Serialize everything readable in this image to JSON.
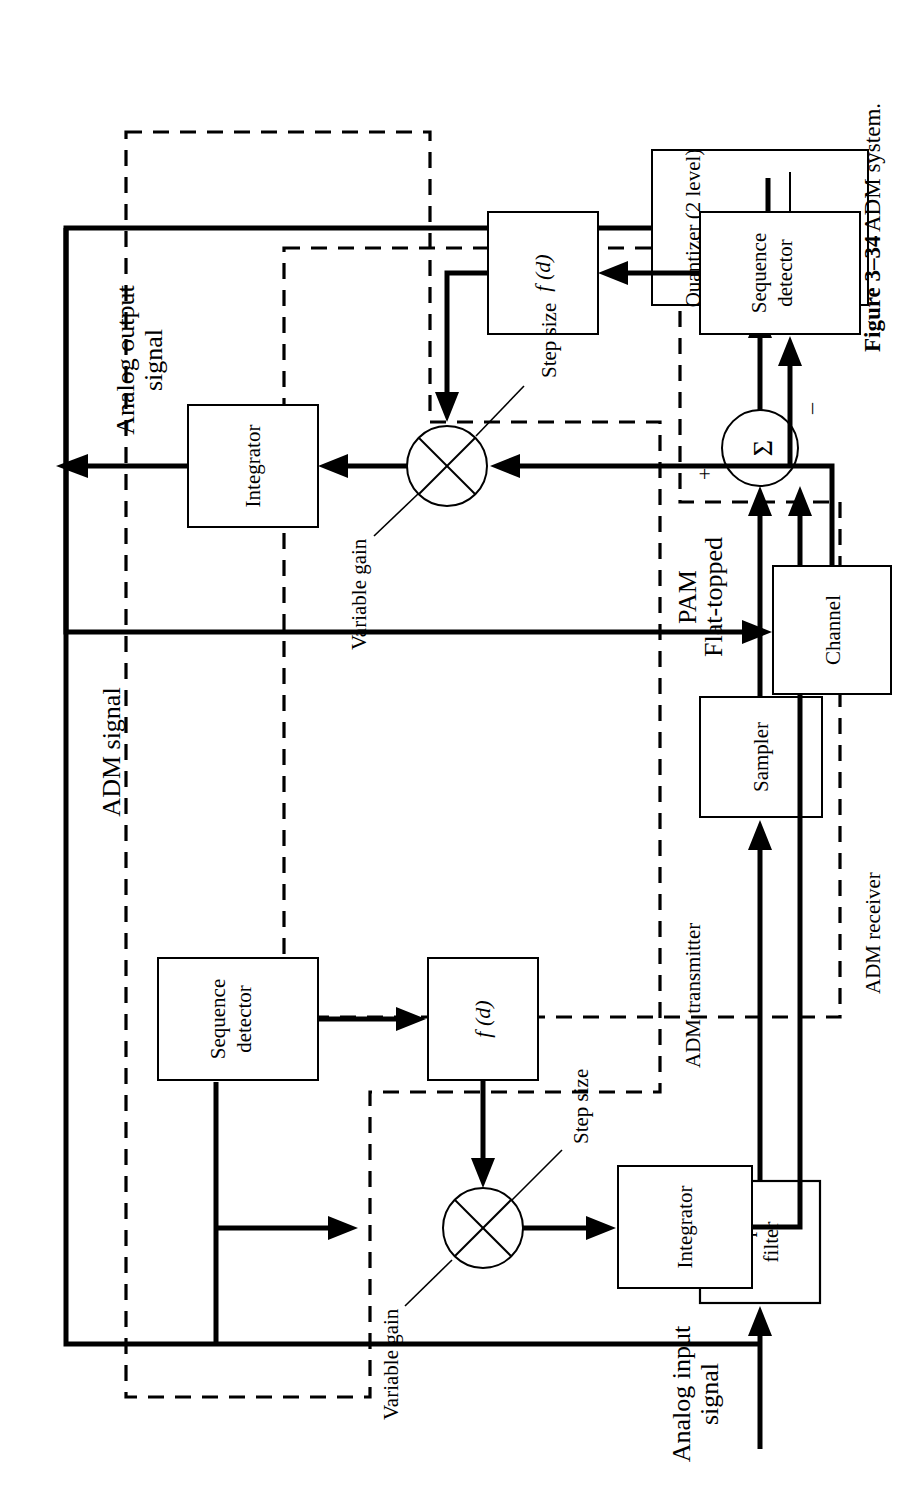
{
  "figure": {
    "caption_number": "Figure 3–34",
    "caption_text": "ADM system."
  },
  "diagram": {
    "type": "block-diagram",
    "orientation": "rotated-90-ccw",
    "signals": {
      "input": "Analog input\nsignal",
      "input_line1": "Analog input",
      "input_line2": "signal",
      "pam_line1": "Flat-topped",
      "pam_line2": "PAM",
      "adm": "ADM signal",
      "output_line1": "Analog output",
      "output_line2": "signal"
    },
    "groups": [
      {
        "id": "transmitter",
        "label": "ADM transmitter"
      },
      {
        "id": "receiver",
        "label": "ADM receiver"
      }
    ],
    "blocks": [
      {
        "id": "lpf",
        "line1": "Low-pass",
        "line2": "filter"
      },
      {
        "id": "sampler",
        "line1": "Sampler",
        "line2": ""
      },
      {
        "id": "summer",
        "line1": "Σ",
        "line2": "",
        "shape": "circle"
      },
      {
        "id": "quantizer",
        "line1": "Quantizer (2 level)",
        "line2": "",
        "shape": "rect-with-staircase"
      },
      {
        "id": "tx-seqdet",
        "line1": "Sequence",
        "line2": "detector"
      },
      {
        "id": "tx-fd",
        "line1": "f (d)",
        "line2": "",
        "italic": true
      },
      {
        "id": "tx-mult",
        "line1": "⊗",
        "line2": "",
        "shape": "circle-cross"
      },
      {
        "id": "tx-integ",
        "line1": "Integrator",
        "line2": ""
      },
      {
        "id": "channel",
        "line1": "Channel",
        "line2": ""
      },
      {
        "id": "rx-seqdet",
        "line1": "Sequence",
        "line2": "detector"
      },
      {
        "id": "rx-fd",
        "line1": "f (d)",
        "line2": "",
        "italic": true
      },
      {
        "id": "rx-mult",
        "line1": "⊗",
        "line2": "",
        "shape": "circle-cross"
      },
      {
        "id": "rx-integ",
        "line1": "Integrator",
        "line2": ""
      }
    ],
    "annotations": [
      {
        "id": "tx-variable-gain",
        "text": "Variable gain"
      },
      {
        "id": "tx-step-size",
        "text": "Step size"
      },
      {
        "id": "rx-variable-gain",
        "text": "Variable gain"
      },
      {
        "id": "rx-step-size",
        "text": "Step size"
      },
      {
        "id": "summer-plus",
        "text": "+"
      },
      {
        "id": "summer-minus",
        "text": "–"
      }
    ],
    "colors": {
      "line": "#000000",
      "background": "#ffffff"
    }
  }
}
